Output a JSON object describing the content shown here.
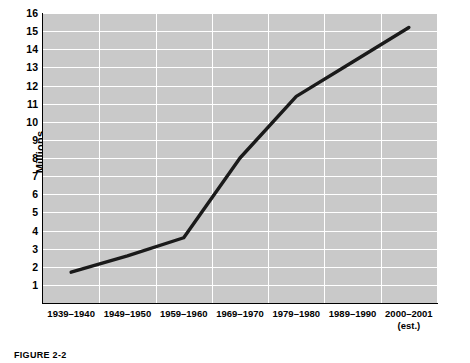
{
  "chart_data": {
    "type": "line",
    "title": "",
    "xlabel": "",
    "ylabel": "Millions",
    "categories": [
      "1939–1940",
      "1949–1950",
      "1959–1960",
      "1969–1970",
      "1979–1980",
      "1989–1990",
      "2000–2001"
    ],
    "category_sublabels": [
      "",
      "",
      "",
      "",
      "",
      "",
      "(est.)"
    ],
    "values": [
      1.7,
      2.6,
      3.6,
      8.0,
      11.4,
      13.3,
      15.2
    ],
    "ylim": [
      0,
      16
    ],
    "yticks": [
      16,
      15,
      14,
      13,
      12,
      11,
      10,
      9,
      8,
      7,
      6,
      5,
      4,
      3,
      2,
      1
    ],
    "grid": true,
    "legend": "none",
    "series_color": "#1a1a1a",
    "plot_background": "#c9c9c9",
    "gridline_color": "#ffffff",
    "axis_color": "#000000"
  },
  "caption": {
    "text": "FIGURE 2-2"
  }
}
